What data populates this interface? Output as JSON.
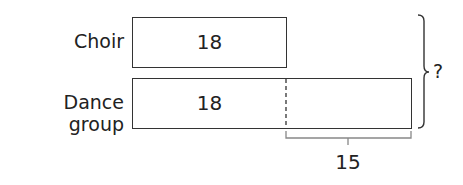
{
  "diagram": {
    "type": "bar-model",
    "rows": [
      {
        "label": "Choir",
        "value": "18"
      },
      {
        "label": "Dance group",
        "value": "18"
      }
    ],
    "difference": "15",
    "total": "?"
  }
}
